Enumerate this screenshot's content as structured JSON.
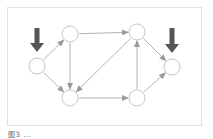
{
  "diagram": {
    "type": "directed-graph",
    "colors": {
      "node_stroke": "#c8c8c8",
      "edge": "#b4b4b4",
      "marker_arrow": "#555555",
      "frame": "#e2e2e2"
    },
    "nodes": [
      {
        "id": "A",
        "x": 37,
        "y": 66,
        "r": 8
      },
      {
        "id": "B",
        "x": 70,
        "y": 34,
        "r": 8
      },
      {
        "id": "C",
        "x": 70,
        "y": 98,
        "r": 8
      },
      {
        "id": "D",
        "x": 137,
        "y": 32,
        "r": 8
      },
      {
        "id": "E",
        "x": 137,
        "y": 98,
        "r": 8
      },
      {
        "id": "F",
        "x": 172,
        "y": 67,
        "r": 8
      }
    ],
    "edges": [
      {
        "from": "A",
        "to": "B"
      },
      {
        "from": "A",
        "to": "C"
      },
      {
        "from": "B",
        "to": "C"
      },
      {
        "from": "B",
        "to": "D"
      },
      {
        "from": "D",
        "to": "C"
      },
      {
        "from": "C",
        "to": "E"
      },
      {
        "from": "E",
        "to": "D"
      },
      {
        "from": "D",
        "to": "F"
      },
      {
        "from": "E",
        "to": "F"
      }
    ],
    "markers": [
      {
        "label": "source-marker",
        "target": "A",
        "x": 37,
        "y1": 28,
        "y2": 52
      },
      {
        "label": "sink-marker",
        "target": "F",
        "x": 172,
        "y1": 28,
        "y2": 53
      }
    ]
  },
  "caption": {
    "text": "图3 ..."
  }
}
